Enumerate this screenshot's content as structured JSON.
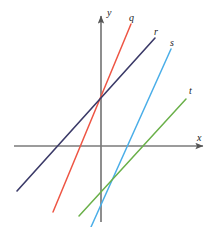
{
  "figure": {
    "background_color": "#ffffff",
    "width": 218,
    "height": 227
  },
  "axes": {
    "color": "#7a7a7a",
    "origin": {
      "x": 101,
      "y": 146
    },
    "x_axis": {
      "label": "x",
      "label_position": {
        "x": 197,
        "y": 133
      },
      "start": {
        "x": 14,
        "y": 146
      },
      "end": {
        "x": 206,
        "y": 146
      },
      "arrow": "right"
    },
    "y_axis": {
      "label": "y",
      "label_position": {
        "x": 107,
        "y": 8
      },
      "start": {
        "x": 101,
        "y": 222
      },
      "end": {
        "x": 101,
        "y": 12
      },
      "arrow": "up"
    }
  },
  "chart_data": {
    "type": "line",
    "title": "",
    "xlabel": "x",
    "ylabel": "y",
    "grid": false,
    "legend": "inline-end-labels",
    "xlim": [
      -4.35,
      5.25
    ],
    "ylim": [
      -3.8,
      6.7
    ],
    "series": [
      {
        "name": "q",
        "label": "q",
        "color": "#ee5544",
        "label_position": {
          "x": 129,
          "y": 13
        },
        "pixel_start": {
          "x": 53,
          "y": 212
        },
        "pixel_end": {
          "x": 131,
          "y": 24
        },
        "y_intercept": 2.35,
        "x_intercept": -1.15,
        "slope": 2.41
      },
      {
        "name": "r",
        "label": "r",
        "color": "#3b3a68",
        "label_position": {
          "x": 154,
          "y": 27
        },
        "pixel_start": {
          "x": 17,
          "y": 191
        },
        "pixel_end": {
          "x": 155,
          "y": 38
        },
        "y_intercept": 2.35,
        "x_intercept": -2.05,
        "slope": 1.11
      },
      {
        "name": "s",
        "label": "s",
        "color": "#4aaee8",
        "label_position": {
          "x": 170,
          "y": 38
        },
        "pixel_start": {
          "x": 91,
          "y": 227
        },
        "pixel_end": {
          "x": 171,
          "y": 49
        },
        "y_intercept": -2.3,
        "x_intercept": 1.0,
        "slope": 2.23
      },
      {
        "name": "t",
        "label": "t",
        "color": "#6ab049",
        "label_position": {
          "x": 189,
          "y": 86
        },
        "pixel_start": {
          "x": 79,
          "y": 216
        },
        "pixel_end": {
          "x": 186,
          "y": 99
        },
        "y_intercept": -2.5,
        "x_intercept": 2.2,
        "slope": 1.09
      }
    ],
    "annotations": [
      {
        "text": "lines q and r intersect on the y-axis",
        "pixel": {
          "x": 101,
          "y": 99
        }
      },
      {
        "text": "lines s and t intersect below the x-axis",
        "pixel": {
          "x": 100,
          "y": 196
        }
      }
    ]
  }
}
